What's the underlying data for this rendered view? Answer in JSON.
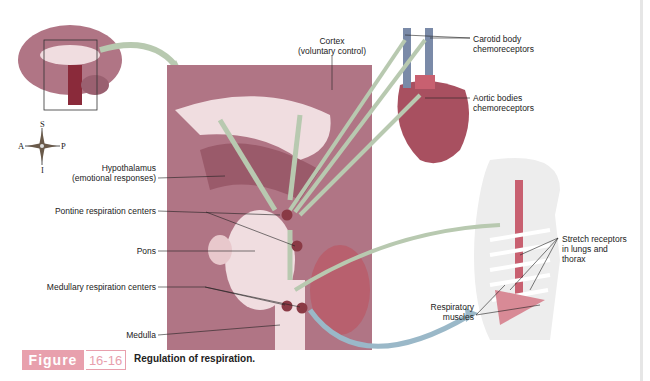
{
  "figure": {
    "badge": "Figure",
    "number": "16-16",
    "caption": "Regulation of respiration."
  },
  "compass": {
    "superior": "S",
    "anterior": "A",
    "posterior": "P",
    "inferior": "I"
  },
  "labels": {
    "cortex_line1": "Cortex",
    "cortex_line2": "(voluntary control)",
    "carotid_line1": "Carotid body",
    "carotid_line2": "chemoreceptors",
    "aortic_line1": "Aortic bodies",
    "aortic_line2": "chemoreceptors",
    "hypothalamus_line1": "Hypothalamus",
    "hypothalamus_line2": "(emotional responses)",
    "pontine": "Pontine respiration centers",
    "pons": "Pons",
    "medullary": "Medullary respiration centers",
    "medulla": "Medulla",
    "stretch_line1": "Stretch receptors",
    "stretch_line2": "in lungs and",
    "stretch_line3": "thorax",
    "resp_line1": "Respiratory",
    "resp_line2": "muscles"
  },
  "colors": {
    "badge": "#e8a0ad",
    "brain_tissue": "#a0697a",
    "brain_light": "#f0dde0",
    "arrow": "#b8c9b0",
    "center_dot": "#8a3a45",
    "heart": "#a85060",
    "vessel": "#7a8aa8"
  }
}
